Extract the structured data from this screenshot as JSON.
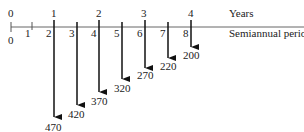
{
  "diagram": {
    "type": "cash-flow-timeline",
    "axis": {
      "years_label": "Years",
      "periods_label": "Semiannual periods",
      "year_ticks": [
        "0",
        "1",
        "2",
        "3",
        "4"
      ],
      "period_ticks": [
        "0",
        "1",
        "2",
        "3",
        "4",
        "5",
        "6",
        "7",
        "8"
      ]
    },
    "cash_flows": [
      {
        "period": 2,
        "amount": "470",
        "direction": "down"
      },
      {
        "period": 3,
        "amount": "420",
        "direction": "down"
      },
      {
        "period": 4,
        "amount": "370",
        "direction": "down"
      },
      {
        "period": 5,
        "amount": "320",
        "direction": "down"
      },
      {
        "period": 6,
        "amount": "270",
        "direction": "down"
      },
      {
        "period": 7,
        "amount": "220",
        "direction": "down"
      },
      {
        "period": 8,
        "amount": "200",
        "direction": "down"
      }
    ]
  }
}
